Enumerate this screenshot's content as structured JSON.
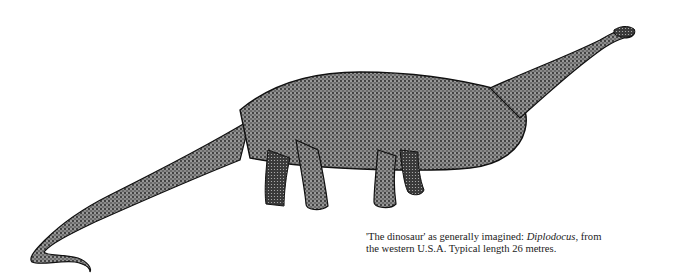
{
  "figure": {
    "style": "stippled black and white drawing",
    "colors": {
      "ink": "#111111",
      "background": "#ffffff"
    }
  },
  "caption": {
    "part1": "'The dinosaur' as generally imagined: ",
    "italic": "Diplodocus",
    "part2": ", from",
    "line2": "the western U.S.A. Typical length 26 metres."
  }
}
